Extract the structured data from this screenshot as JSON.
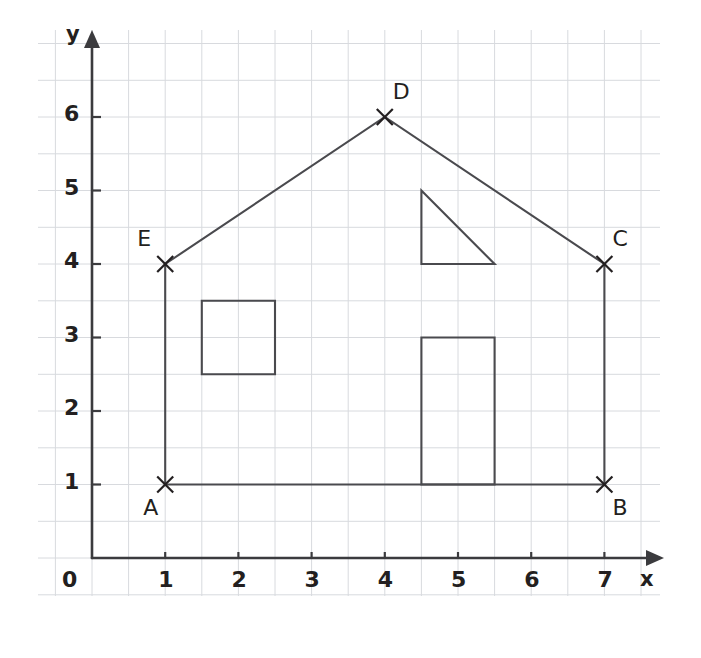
{
  "figure": {
    "kind": "coordinate-grid-house-diagram",
    "background": "#ffffff",
    "grid_color": "#d8dade",
    "axis_color": "#3b3b3e",
    "shape_color": "#4a4a4e",
    "text_color": "#231f20"
  },
  "axes": {
    "x_label": "x",
    "y_label": "y",
    "origin_label": "0",
    "x_ticks": [
      "1",
      "2",
      "3",
      "4",
      "5",
      "6",
      "7"
    ],
    "y_ticks": [
      "1",
      "2",
      "3",
      "4",
      "5",
      "6"
    ],
    "x_range": [
      0,
      7.7
    ],
    "y_range": [
      0,
      7.3
    ],
    "x_tick_values": [
      1,
      2,
      3,
      4,
      5,
      6,
      7
    ],
    "y_tick_values": [
      1,
      2,
      3,
      4,
      5,
      6
    ]
  },
  "chart_data": {
    "type": "scatter",
    "title": "",
    "xlabel": "x",
    "ylabel": "y",
    "xlim": [
      0,
      7.7
    ],
    "ylim": [
      0,
      7.3
    ],
    "grid": true,
    "grid_step": 0.5,
    "legend": "none",
    "points": [
      {
        "label": "A",
        "x": 1,
        "y": 1,
        "marker": "x",
        "label_pos": "below-left"
      },
      {
        "label": "B",
        "x": 7,
        "y": 1,
        "marker": "x",
        "label_pos": "below-right"
      },
      {
        "label": "C",
        "x": 7,
        "y": 4,
        "marker": "x",
        "label_pos": "above-right"
      },
      {
        "label": "D",
        "x": 4,
        "y": 6,
        "marker": "x",
        "label_pos": "above-right"
      },
      {
        "label": "E",
        "x": 1,
        "y": 4,
        "marker": "x",
        "label_pos": "above-left"
      }
    ],
    "polylines": [
      {
        "name": "house-outline",
        "closed": true,
        "points": [
          [
            1,
            1
          ],
          [
            7,
            1
          ],
          [
            7,
            4
          ],
          [
            4,
            6
          ],
          [
            1,
            4
          ]
        ]
      },
      {
        "name": "window-square",
        "closed": true,
        "points": [
          [
            1.5,
            2.5
          ],
          [
            2.5,
            2.5
          ],
          [
            2.5,
            3.5
          ],
          [
            1.5,
            3.5
          ]
        ]
      },
      {
        "name": "door-rectangle",
        "closed": true,
        "points": [
          [
            4.5,
            1
          ],
          [
            5.5,
            1
          ],
          [
            5.5,
            3
          ],
          [
            4.5,
            3
          ]
        ]
      },
      {
        "name": "attic-triangle",
        "closed": true,
        "points": [
          [
            4.5,
            5
          ],
          [
            5.5,
            4
          ],
          [
            4.5,
            4
          ]
        ]
      }
    ]
  }
}
